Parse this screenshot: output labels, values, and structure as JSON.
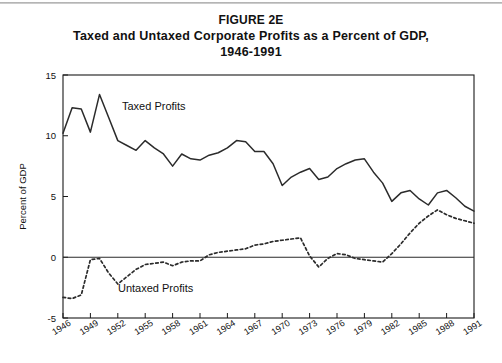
{
  "figure": {
    "label": "FIGURE 2E",
    "title_line1": "Taxed and Untaxed Corporate Profits as a Percent of GDP,",
    "title_line2": "1946-1991"
  },
  "chart_data": {
    "type": "line",
    "title": "Taxed and Untaxed Corporate Profits as a Percent of GDP, 1946-1991",
    "xlabel": "",
    "ylabel": "Percent of GDP",
    "xlim": [
      1946,
      1991
    ],
    "ylim": [
      -5,
      15
    ],
    "yticks": [
      -5,
      0,
      5,
      10,
      15
    ],
    "ytick_labels": [
      "-5",
      "0",
      "5",
      "10",
      "15"
    ],
    "xticks": [
      1946,
      1949,
      1952,
      1955,
      1958,
      1961,
      1964,
      1967,
      1970,
      1973,
      1976,
      1979,
      1982,
      1985,
      1988,
      1991
    ],
    "xtick_labels": [
      "1946",
      "1949",
      "1952",
      "1955",
      "1958",
      "1961",
      "1964",
      "1967",
      "1970",
      "1973",
      "1976",
      "1979",
      "1982",
      "1985",
      "1988",
      "1991"
    ],
    "grid": false,
    "legend_position": "inline-annotations",
    "zero_line": 0,
    "x": [
      1946,
      1947,
      1948,
      1949,
      1950,
      1951,
      1952,
      1953,
      1954,
      1955,
      1956,
      1957,
      1958,
      1959,
      1960,
      1961,
      1962,
      1963,
      1964,
      1965,
      1966,
      1967,
      1968,
      1969,
      1970,
      1971,
      1972,
      1973,
      1974,
      1975,
      1976,
      1977,
      1978,
      1979,
      1980,
      1981,
      1982,
      1983,
      1984,
      1985,
      1986,
      1987,
      1988,
      1989,
      1990,
      1991
    ],
    "series": [
      {
        "name": "Taxed Profits",
        "style": "solid",
        "annotation": "Taxed Profits",
        "values": [
          10.2,
          12.3,
          12.2,
          10.3,
          13.4,
          11.5,
          9.6,
          9.2,
          8.8,
          9.6,
          9.0,
          8.5,
          7.5,
          8.5,
          8.1,
          8.0,
          8.4,
          8.6,
          9.0,
          9.6,
          9.5,
          8.7,
          8.7,
          7.7,
          5.9,
          6.6,
          7.0,
          7.3,
          6.4,
          6.6,
          7.3,
          7.7,
          8.0,
          8.1,
          7.0,
          6.1,
          4.6,
          5.3,
          5.5,
          4.8,
          4.3,
          5.3,
          5.5,
          4.9,
          4.2,
          3.8
        ]
      },
      {
        "name": "Untaxed Profits",
        "style": "dotted",
        "annotation": "Untaxed Profits",
        "values": [
          -3.3,
          -3.4,
          -3.1,
          -0.2,
          -0.1,
          -1.3,
          -2.2,
          -1.6,
          -1.0,
          -0.6,
          -0.5,
          -0.4,
          -0.7,
          -0.4,
          -0.3,
          -0.3,
          0.2,
          0.4,
          0.5,
          0.6,
          0.7,
          1.0,
          1.1,
          1.3,
          1.4,
          1.5,
          1.6,
          0.1,
          -0.8,
          -0.1,
          0.3,
          0.2,
          -0.1,
          -0.2,
          -0.3,
          -0.4,
          0.3,
          1.1,
          2.0,
          2.8,
          3.4,
          3.9,
          3.5,
          3.2,
          3.0,
          2.8
        ]
      }
    ]
  }
}
